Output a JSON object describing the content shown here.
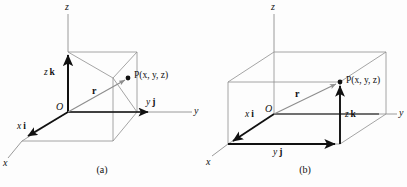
{
  "figure": {
    "background_color": "#fdfdfd",
    "axis_color": "#111111",
    "construction_color": "#8e8e8e",
    "text_color": "#111111"
  },
  "panels": [
    {
      "id": "a",
      "caption": "(a)",
      "axes": [
        {
          "name": "z",
          "label": "z"
        },
        {
          "name": "y",
          "label": "y"
        },
        {
          "name": "x",
          "label": "x"
        }
      ],
      "labels": {
        "origin": "O",
        "point": "P(x, y, z)",
        "position_vector": "r",
        "component_x": {
          "scalar": "x",
          "unit": "i"
        },
        "component_y": {
          "scalar": "y",
          "unit": "j"
        },
        "component_z": {
          "scalar": "z",
          "unit": "k"
        }
      }
    },
    {
      "id": "b",
      "caption": "(b)",
      "axes": [
        {
          "name": "z",
          "label": "z"
        },
        {
          "name": "y",
          "label": "y"
        },
        {
          "name": "x",
          "label": "x"
        }
      ],
      "labels": {
        "origin": "O",
        "point": "P(x, y, z)",
        "position_vector": "r",
        "component_x": {
          "scalar": "x",
          "unit": "i"
        },
        "component_y": {
          "scalar": "y",
          "unit": "j"
        },
        "component_z": {
          "scalar": "z",
          "unit": "k"
        }
      }
    }
  ]
}
